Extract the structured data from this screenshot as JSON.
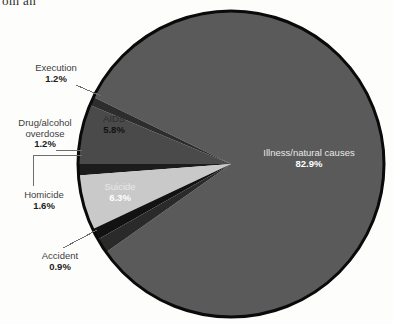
{
  "page": {
    "bleed_text": "om an",
    "background_color": "#fdfdfc"
  },
  "chart_data": {
    "type": "pie",
    "title": "",
    "subtitle": "",
    "xlabel": "",
    "ylabel": "",
    "legend_position": "none",
    "units": "percent",
    "total": 100,
    "categories": [
      "Execution",
      "AIDS",
      "Drug/alcohol overdose",
      "Homicide",
      "Suicide",
      "Accident",
      "Illness/natural causes"
    ],
    "values": [
      1.2,
      5.8,
      1.2,
      1.6,
      6.3,
      0.9,
      82.9
    ],
    "slices": [
      {
        "label": "Execution",
        "value": 1.2,
        "value_text": "1.2%",
        "color": "#1c1c1c",
        "label_placement": "outside",
        "label_color": "#3a3a3a"
      },
      {
        "label": "AIDS",
        "value": 5.8,
        "value_text": "5.8%",
        "color": "#c9c9c9",
        "label_placement": "inside",
        "label_color": "#2e2e2e"
      },
      {
        "label": "Drug/alcohol overdose",
        "value": 1.2,
        "value_text": "1.2%",
        "color": "#121212",
        "label_placement": "outside",
        "label_color": "#3a3a3a"
      },
      {
        "label": "Homicide",
        "value": 1.6,
        "value_text": "1.6%",
        "color": "#2a2a2a",
        "label_placement": "outside",
        "label_color": "#3a3a3a"
      },
      {
        "label": "Suicide",
        "value": 6.3,
        "value_text": "6.3%",
        "color": "#4a4a4a",
        "label_placement": "inside",
        "label_color": "#ffffff"
      },
      {
        "label": "Accident",
        "value": 0.9,
        "value_text": "0.9%",
        "color": "#2d2d2d",
        "label_placement": "outside",
        "label_color": "#3a3a3a"
      },
      {
        "label": "Illness/natural causes",
        "value": 82.9,
        "value_text": "82.9%",
        "color": "#5a5a5a",
        "label_placement": "inside",
        "label_color": "#ffffff"
      }
    ],
    "geometry": {
      "center_x": 231,
      "center_y": 164,
      "radius": 153,
      "outline_color": "#0a0a0a",
      "outline_width": 3
    }
  },
  "callouts": {
    "execution": {
      "category": "Execution",
      "percent": "1.2%"
    },
    "drug_overdose": {
      "category_line1": "Drug/alcohol",
      "category_line2": "overdose",
      "percent": "1.2%"
    },
    "homicide": {
      "category": "Homicide",
      "percent": "1.6%"
    },
    "accident": {
      "category": "Accident",
      "percent": "0.9%"
    }
  },
  "inpie_labels": {
    "aids": {
      "category": "AIDS",
      "percent": "5.8%"
    },
    "suicide": {
      "category": "Suicide",
      "percent": "6.3%"
    },
    "illness": {
      "category": "Illness/natural causes",
      "percent": "82.9%"
    }
  }
}
